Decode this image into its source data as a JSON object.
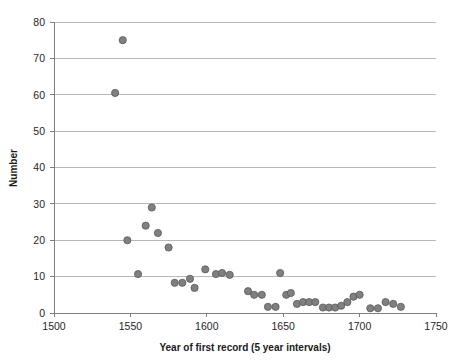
{
  "chart_data": {
    "type": "scatter",
    "title": "",
    "xlabel": "Year of first record (5 year intervals)",
    "ylabel": "Number",
    "xlim": [
      1500,
      1750
    ],
    "ylim": [
      0,
      80
    ],
    "xticks": [
      1500,
      1550,
      1600,
      1650,
      1700,
      1750
    ],
    "yticks": [
      0,
      10,
      20,
      30,
      40,
      50,
      60,
      70,
      80
    ],
    "grid": true,
    "legend": false,
    "marker": {
      "shape": "circle",
      "fill": "#808080",
      "stroke": "#595959",
      "radius": 3.6
    },
    "series": [
      {
        "name": "First records",
        "points": [
          [
            1540,
            60.5
          ],
          [
            1545,
            75.0
          ],
          [
            1548,
            20.0
          ],
          [
            1555,
            10.7
          ],
          [
            1560,
            24.0
          ],
          [
            1564,
            29.0
          ],
          [
            1568,
            22.0
          ],
          [
            1575,
            18.0
          ],
          [
            1579,
            8.3
          ],
          [
            1584,
            8.3
          ],
          [
            1589,
            9.4
          ],
          [
            1592,
            6.9
          ],
          [
            1599,
            12.0
          ],
          [
            1606,
            10.7
          ],
          [
            1610,
            11.0
          ],
          [
            1615,
            10.5
          ],
          [
            1627,
            6.0
          ],
          [
            1631,
            5.0
          ],
          [
            1636,
            5.0
          ],
          [
            1640,
            1.7
          ],
          [
            1645,
            1.7
          ],
          [
            1648,
            11.0
          ],
          [
            1652,
            5.0
          ],
          [
            1655,
            5.5
          ],
          [
            1659,
            2.5
          ],
          [
            1663,
            3.0
          ],
          [
            1667,
            3.0
          ],
          [
            1671,
            3.0
          ],
          [
            1676,
            1.5
          ],
          [
            1680,
            1.5
          ],
          [
            1684,
            1.5
          ],
          [
            1688,
            2.0
          ],
          [
            1692,
            3.0
          ],
          [
            1696,
            4.5
          ],
          [
            1700,
            5.0
          ],
          [
            1707,
            1.3
          ],
          [
            1712,
            1.3
          ],
          [
            1717,
            3.0
          ],
          [
            1722,
            2.5
          ],
          [
            1727,
            1.7
          ]
        ]
      }
    ]
  },
  "axes": {
    "y_tick_labels": [
      "0",
      "10",
      "20",
      "30",
      "40",
      "50",
      "60",
      "70",
      "80"
    ],
    "x_tick_labels": [
      "1500",
      "1550",
      "1600",
      "1650",
      "1700",
      "1750"
    ]
  },
  "colors": {
    "marker_fill": "#808080",
    "marker_stroke": "#595959",
    "gridline": "#a6a6a6",
    "axis": "#7f7f7f",
    "text": "#262626",
    "background": "#ffffff"
  }
}
